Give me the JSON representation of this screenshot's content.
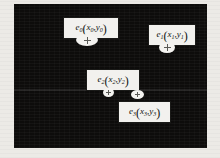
{
  "figure": {
    "canvas": {
      "background_color": "#0d0c0b",
      "page_background_color": "#eceae6",
      "x": 14,
      "y": 4,
      "width": 193,
      "height": 144
    },
    "artifact_band": {
      "y": 89,
      "opacity_label": "faint-scanline"
    },
    "points": [
      {
        "id": "e0",
        "label": {
          "name": "e",
          "name_sub": "0",
          "x_var": "x",
          "x_sub": "0",
          "y_var": "y",
          "y_sub": "0",
          "full_text": "e0(x0,y0)"
        },
        "label_box": {
          "x": 63,
          "y": 17,
          "width": 48,
          "height": 15
        },
        "marker": {
          "cx": 87,
          "cy": 40,
          "rx": 11,
          "ry": 6,
          "glyph": "plus"
        }
      },
      {
        "id": "e1",
        "label": {
          "name": "e",
          "name_sub": "1",
          "x_var": "x",
          "x_sub": "1",
          "y_var": "y",
          "y_sub": "1",
          "full_text": "e1(x1,y1)"
        },
        "label_box": {
          "x": 148,
          "y": 24,
          "width": 40,
          "height": 15
        },
        "marker": {
          "cx": 167,
          "cy": 47,
          "rx": 8,
          "ry": 5,
          "glyph": "plus"
        }
      },
      {
        "id": "e2",
        "label": {
          "name": "e",
          "name_sub": "2",
          "x_var": "x",
          "x_sub": "2",
          "y_var": "y",
          "y_sub": "2",
          "full_text": "e2(x2,y2)"
        },
        "label_box": {
          "x": 86,
          "y": 69,
          "width": 46,
          "height": 15
        },
        "marker": {
          "cx": 108,
          "cy": 92,
          "rx": 5,
          "ry": 4,
          "glyph": "plus"
        }
      },
      {
        "id": "e3",
        "label": {
          "name": "e",
          "name_sub": "3",
          "x_var": "x",
          "x_sub": "3",
          "y_var": "y",
          "y_sub": "3",
          "full_text": "e3(x3,y3)"
        },
        "label_box": {
          "x": 118,
          "y": 101,
          "width": 45,
          "height": 15
        },
        "marker": {
          "cx": 137,
          "cy": 94,
          "rx": 6,
          "ry": 4,
          "glyph": "plus"
        }
      }
    ]
  }
}
